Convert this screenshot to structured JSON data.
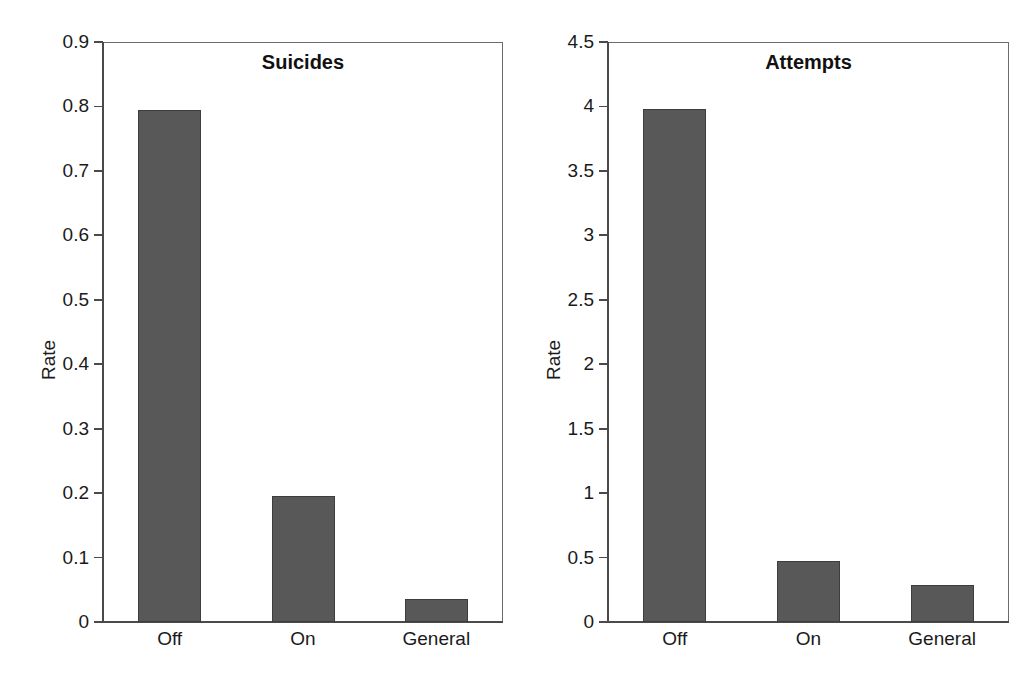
{
  "chart_data": [
    {
      "type": "bar",
      "title": "Suicides",
      "xlabel": "",
      "ylabel": "Rate",
      "categories": [
        "Off",
        "On",
        "General"
      ],
      "values": [
        0.795,
        0.195,
        0.035
      ],
      "ylim": [
        0,
        0.9
      ],
      "yticks": [
        0,
        0.1,
        0.2,
        0.3,
        0.4,
        0.5,
        0.6,
        0.7,
        0.8,
        0.9
      ],
      "ytick_labels": [
        "0",
        "0.1",
        "0.2",
        "0.3",
        "0.4",
        "0.5",
        "0.6",
        "0.7",
        "0.8",
        "0.9"
      ],
      "grid": false,
      "legend": null,
      "bar_color": "#585858",
      "bar_edge_color": "#3d3d3d"
    },
    {
      "type": "bar",
      "title": "Attempts",
      "xlabel": "",
      "ylabel": "Rate",
      "categories": [
        "Off",
        "On",
        "General"
      ],
      "values": [
        3.98,
        0.475,
        0.285
      ],
      "ylim": [
        0,
        4.5
      ],
      "yticks": [
        0,
        0.5,
        1,
        1.5,
        2,
        2.5,
        3,
        3.5,
        4,
        4.5
      ],
      "ytick_labels": [
        "0",
        "0.5",
        "1",
        "1.5",
        "2",
        "2.5",
        "3",
        "3.5",
        "4",
        "4.5"
      ],
      "grid": false,
      "legend": null,
      "bar_color": "#585858",
      "bar_edge_color": "#3d3d3d"
    }
  ],
  "figure": {
    "background": "#ffffff",
    "panels": 2
  }
}
